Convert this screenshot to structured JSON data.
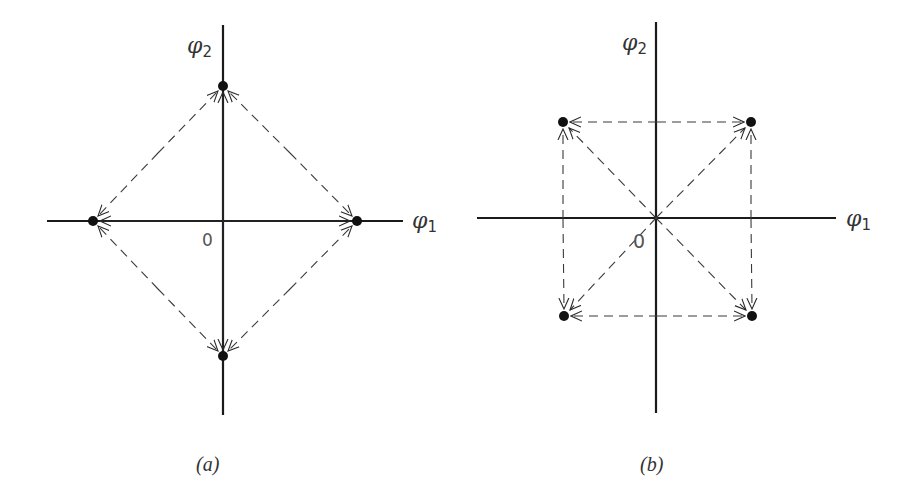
{
  "panels": [
    {
      "id": "a",
      "caption": "(a)",
      "x_axis_label": "φ",
      "x_axis_sub": "1",
      "y_axis_label": "φ",
      "y_axis_sub": "2",
      "origin_label": "0",
      "description": "Four fixed points on the axes forming a diamond; dashed flow lines between neighbouring fixed points, solid flows along axes from origin outward",
      "points": [
        {
          "name": "top",
          "x": 0,
          "y": 1
        },
        {
          "name": "left",
          "x": -1,
          "y": 0
        },
        {
          "name": "right",
          "x": 1,
          "y": 0
        },
        {
          "name": "bottom",
          "x": 0,
          "y": -1
        }
      ]
    },
    {
      "id": "b",
      "caption": "(b)",
      "x_axis_label": "φ",
      "x_axis_sub": "1",
      "y_axis_label": "φ",
      "y_axis_sub": "2",
      "origin_label": "0",
      "description": "Four fixed points at diagonal corners forming a square; dashed flow lines along square edges and diagonals from origin to each corner",
      "points": [
        {
          "name": "top-left",
          "x": -1,
          "y": 1
        },
        {
          "name": "top-right",
          "x": 1,
          "y": 1
        },
        {
          "name": "bottom-left",
          "x": -1,
          "y": -1
        },
        {
          "name": "bottom-right",
          "x": 1,
          "y": -1
        }
      ]
    }
  ]
}
